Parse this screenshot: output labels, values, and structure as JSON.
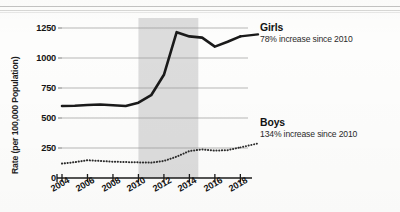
{
  "chart_data": {
    "type": "line",
    "title": "",
    "xlabel": "",
    "ylabel": "Rate (per 100,000 Population)",
    "xlim": [
      2004,
      2018.6
    ],
    "ylim": [
      0,
      1300
    ],
    "yticks": [
      0,
      250,
      500,
      750,
      1000,
      1250
    ],
    "ytick_labels": [
      "0",
      "250",
      "500",
      "750",
      "1000",
      "1250"
    ],
    "xticks": [
      2004,
      2006,
      2008,
      2010,
      2012,
      2014,
      2016,
      2018
    ],
    "xtick_labels": [
      "2004",
      "2006",
      "2008",
      "2010",
      "2012",
      "2014",
      "2016",
      "2018"
    ],
    "grid": "horizontal",
    "legend_position": "right-inline",
    "shaded_region": {
      "label": "",
      "x_start": 2010.0,
      "x_end": 2014.7,
      "color": "#d9d9d9"
    },
    "x": [
      2004,
      2005,
      2006,
      2007,
      2008,
      2009,
      2010,
      2011,
      2012,
      2013,
      2014,
      2015,
      2016,
      2017,
      2018
    ],
    "series": [
      {
        "name": "Girls",
        "style": "solid",
        "color": "#1a1a1a",
        "annotation": "78% increase since 2010",
        "values": [
          600,
          602,
          608,
          612,
          606,
          600,
          628,
          690,
          860,
          1215,
          1180,
          1170,
          1095,
          1135,
          1180
        ]
      },
      {
        "name": "Boys",
        "style": "dotted",
        "color": "#2b2b2b",
        "annotation": "134% increase since 2010",
        "values": [
          120,
          132,
          148,
          142,
          136,
          133,
          130,
          128,
          142,
          178,
          225,
          238,
          228,
          232,
          255
        ]
      }
    ]
  },
  "axis": {
    "y_title": "Rate (per 100,000 Population)"
  },
  "legend": {
    "girls": {
      "label": "Girls",
      "note": "78% increase since 2010"
    },
    "boys": {
      "label": "Boys",
      "note": "134% increase since 2010"
    }
  }
}
